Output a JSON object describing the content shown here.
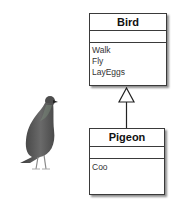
{
  "diagram": {
    "type": "uml-class-inheritance",
    "classes": [
      {
        "name": "Bird",
        "attributes": [],
        "methods": [
          "Walk",
          "Fly",
          "LayEggs"
        ]
      },
      {
        "name": "Pigeon",
        "attributes": [],
        "methods": [
          "Coo"
        ]
      }
    ],
    "relationship": {
      "type": "generalization",
      "from": "Pigeon",
      "to": "Bird",
      "arrowhead": "hollow-triangle"
    },
    "illustration": "pigeon-photo"
  },
  "colors": {
    "border": "#3a3a3a",
    "background": "#ffffff",
    "pigeon_body": "#555555"
  }
}
